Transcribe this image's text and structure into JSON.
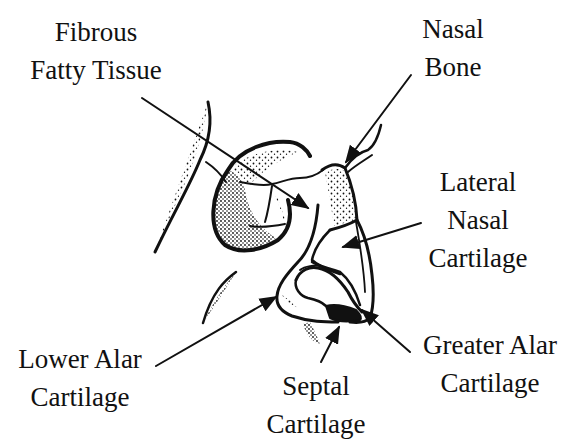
{
  "diagram": {
    "colors": {
      "ink": "#111111",
      "background": "#ffffff"
    },
    "labels": [
      {
        "id": "fibrous-fatty-tissue",
        "lines": [
          "Fibrous",
          "Fatty Tissue"
        ]
      },
      {
        "id": "nasal-bone",
        "lines": [
          "Nasal",
          "Bone"
        ]
      },
      {
        "id": "lateral-nasal-cartilage",
        "lines": [
          "Lateral",
          "Nasal",
          "Cartilage"
        ]
      },
      {
        "id": "lower-alar-cartilage",
        "lines": [
          "Lower Alar",
          "Cartilage"
        ]
      },
      {
        "id": "septal-cartilage",
        "lines": [
          "Septal",
          "Cartilage"
        ]
      },
      {
        "id": "greater-alar-cartilage",
        "lines": [
          "Greater Alar",
          "Cartilage"
        ]
      }
    ]
  }
}
